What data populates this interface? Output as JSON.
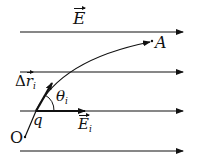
{
  "diagram": {
    "field_label": "E",
    "point_a_label": "A",
    "origin_label": "O",
    "charge_label": "q",
    "displacement_label": {
      "prefix": "Δ",
      "symbol": "r",
      "subscript": "i"
    },
    "angle_label": {
      "symbol": "θ",
      "subscript": "i"
    },
    "local_field_label": {
      "symbol": "E",
      "subscript": "i"
    },
    "field_lines_count": 4,
    "line_color": "#111111"
  }
}
